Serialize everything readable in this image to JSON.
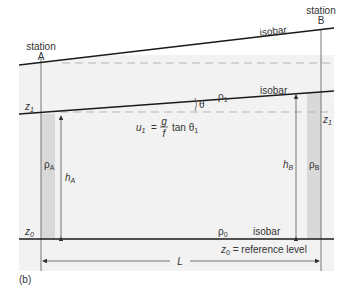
{
  "diagram": {
    "figure_label": "(b)",
    "stations": {
      "a": {
        "label_line1": "station",
        "label_line2": "A"
      },
      "b": {
        "label_line1": "station",
        "label_line2": "B"
      }
    },
    "isobar_top": {
      "label": "isobar"
    },
    "isobar_middle": {
      "label": "isobar",
      "density_label": "ρ",
      "density_sub": "1"
    },
    "isobar_bottom": {
      "label": "isobar",
      "density_label": "ρ",
      "density_sub": "0"
    },
    "angle_label": "θ",
    "z1_left": {
      "main": "z",
      "sub": "1"
    },
    "z1_right": {
      "main": "z",
      "sub": "1"
    },
    "z0_left": {
      "main": "z",
      "sub": "0"
    },
    "reference": {
      "main": "z",
      "sub": "0",
      "text": " = reference level"
    },
    "column_a": {
      "density_main": "ρ",
      "density_sub": "A",
      "height_main": "h",
      "height_sub": "A"
    },
    "column_b": {
      "density_main": "ρ",
      "density_sub": "B",
      "height_main": "h",
      "height_sub": "B"
    },
    "distance_label": "L",
    "formula": {
      "lhs_main": "u",
      "lhs_sub": "1",
      "equals": "=",
      "numerator": "g",
      "denominator": "f",
      "func": "tan θ",
      "func_sub": "1"
    },
    "colors": {
      "background_panel": "#f2f2f2",
      "column_shade": "#d9d9d9",
      "lines": "#1a1a1a",
      "dashed": "#b5b5b5",
      "thin_lines": "#777777"
    }
  }
}
